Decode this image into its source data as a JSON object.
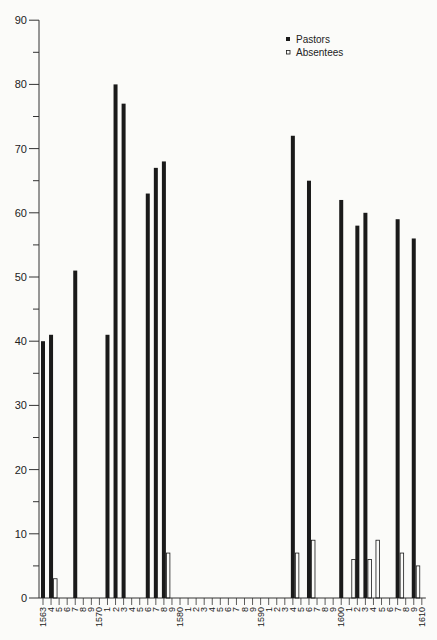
{
  "chart_data": {
    "type": "bar",
    "title": "",
    "xlabel": "",
    "ylabel": "",
    "ylim": [
      0,
      90
    ],
    "yticks": [
      0,
      10,
      20,
      30,
      40,
      50,
      60,
      70,
      80,
      90
    ],
    "xrange": [
      1563,
      1610
    ],
    "x_tick_labels": [
      "1563",
      "4",
      "5",
      "6",
      "7",
      "8",
      "9",
      "1570",
      "1",
      "2",
      "3",
      "4",
      "5",
      "6",
      "7",
      "8",
      "9",
      "1580",
      "1",
      "2",
      "3",
      "4",
      "5",
      "6",
      "7",
      "8",
      "9",
      "1590",
      "1",
      "2",
      "3",
      "4",
      "5",
      "6",
      "7",
      "8",
      "9",
      "1600",
      "1",
      "2",
      "3",
      "4",
      "5",
      "6",
      "7",
      "8",
      "9",
      "1610"
    ],
    "grid": false,
    "legend_position": "top-right",
    "legend": [
      {
        "label": "Pastors",
        "marker": "filled-square"
      },
      {
        "label": "Absentees",
        "marker": "open-square"
      }
    ],
    "series": [
      {
        "name": "Pastors",
        "style": "solid-black",
        "points": [
          {
            "x": 1563,
            "y": 40
          },
          {
            "x": 1564,
            "y": 41
          },
          {
            "x": 1567,
            "y": 51
          },
          {
            "x": 1571,
            "y": 41
          },
          {
            "x": 1572,
            "y": 80
          },
          {
            "x": 1573,
            "y": 77
          },
          {
            "x": 1576,
            "y": 63
          },
          {
            "x": 1577,
            "y": 67
          },
          {
            "x": 1578,
            "y": 68
          },
          {
            "x": 1594,
            "y": 72
          },
          {
            "x": 1596,
            "y": 65
          },
          {
            "x": 1600,
            "y": 62
          },
          {
            "x": 1602,
            "y": 58
          },
          {
            "x": 1603,
            "y": 60
          },
          {
            "x": 1607,
            "y": 59
          },
          {
            "x": 1609,
            "y": 56
          }
        ]
      },
      {
        "name": "Absentees",
        "style": "open-outline",
        "points": [
          {
            "x": 1564,
            "y": 3
          },
          {
            "x": 1578,
            "y": 7
          },
          {
            "x": 1594,
            "y": 7
          },
          {
            "x": 1596,
            "y": 9
          },
          {
            "x": 1601,
            "y": 6
          },
          {
            "x": 1603,
            "y": 6
          },
          {
            "x": 1604,
            "y": 9
          },
          {
            "x": 1607,
            "y": 7
          },
          {
            "x": 1609,
            "y": 5
          }
        ]
      }
    ]
  },
  "colors": {
    "background": "#fbfbf9",
    "pastors": "#1a1a1a",
    "absentees_outline": "#1a1a1a",
    "axis": "#333333"
  }
}
